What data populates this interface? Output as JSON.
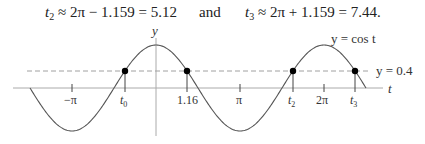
{
  "equations": {
    "left": {
      "var": "t",
      "sub": "2",
      "rhs": " ≈ 2π − 1.159 = 5.12"
    },
    "connector": "and",
    "right": {
      "var": "t",
      "sub": "3",
      "rhs": " ≈ 2π + 1.159 = 7.44."
    }
  },
  "chart_data": {
    "type": "line",
    "title": "",
    "xlabel": "t",
    "ylabel": "y",
    "series": [
      {
        "name": "y = cos t",
        "function": "cos(t)",
        "t_range": [
          -4.712,
          7.854
        ],
        "style": "solid",
        "color": "#555555"
      },
      {
        "name": "y = 0.4",
        "function": "0.4",
        "style": "dashed",
        "color": "#999999"
      }
    ],
    "intersection_points": [
      {
        "label": "t0",
        "t": -1.159,
        "y": 0.4
      },
      {
        "label": "1.16",
        "t": 1.159,
        "y": 0.4
      },
      {
        "label": "t2",
        "t": 5.124,
        "y": 0.4
      },
      {
        "label": "t3",
        "t": 7.442,
        "y": 0.4
      }
    ],
    "x_ticks": [
      {
        "label": "−π",
        "value": -3.1416
      },
      {
        "label": "t0",
        "value": -1.159
      },
      {
        "label": "1.16",
        "value": 1.159
      },
      {
        "label": "π",
        "value": 3.1416
      },
      {
        "label": "t2",
        "value": 5.124
      },
      {
        "label": "2π",
        "value": 6.2832
      },
      {
        "label": "t3",
        "value": 7.442
      }
    ],
    "annotations": [
      {
        "text": "y = cos t",
        "near": "second peak"
      },
      {
        "text": "y = 0.4",
        "near": "right end of dashed line"
      }
    ],
    "grid": false,
    "legend": "none"
  },
  "labels": {
    "y_axis": "y",
    "t_axis": "t",
    "curve": "y = cos t",
    "hline": "y = 0.4",
    "ticks": {
      "neg_pi": "−π",
      "t0_var": "t",
      "t0_sub": "0",
      "v116": "1.16",
      "pi": "π",
      "t2_var": "t",
      "t2_sub": "2",
      "two_pi": "2π",
      "t3_var": "t",
      "t3_sub": "3"
    }
  },
  "colors": {
    "curve": "#555555",
    "axis": "#aaaaaa",
    "dashed": "#a0a0a0",
    "point": "#000000"
  }
}
